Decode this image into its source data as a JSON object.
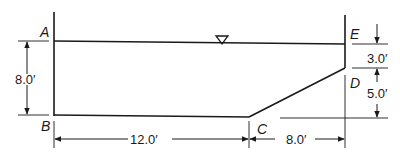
{
  "diagram": {
    "type": "channel cross-section",
    "points": {
      "A": "A",
      "B": "B",
      "C": "C",
      "D": "D",
      "E": "E"
    },
    "dimensions": {
      "depth_AB": "8.0′",
      "width_BC": "12.0′",
      "width_C_to_wall": "8.0′",
      "top_E_to_D": "3.0′",
      "height_D_to_bottom": "5.0′"
    },
    "symbols": {
      "water_surface": "inverted-triangle"
    },
    "colors": {
      "line": "#1a1a1a",
      "background": "#ffffff"
    }
  }
}
